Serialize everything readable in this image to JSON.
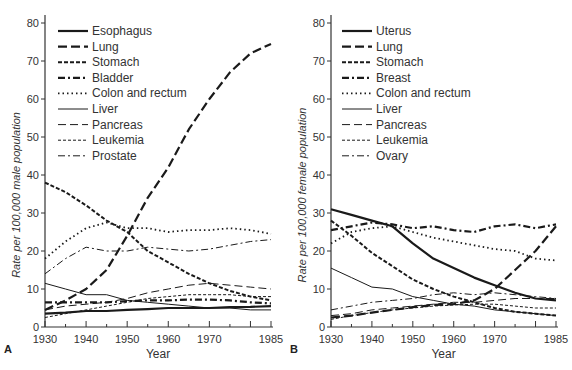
{
  "chart_data": [
    {
      "type": "line",
      "panel": "A",
      "title": "",
      "xlabel": "Year",
      "ylabel": "Rate per 100,000 male population",
      "xlim": [
        1930,
        1985
      ],
      "ylim": [
        0,
        80
      ],
      "xticks": [
        1930,
        1940,
        1950,
        1960,
        1970,
        1985
      ],
      "yticks": [
        0,
        10,
        20,
        30,
        40,
        50,
        60,
        70,
        80
      ],
      "grid": false,
      "legend_position": "upper left",
      "x": [
        1930,
        1935,
        1940,
        1945,
        1950,
        1955,
        1960,
        1965,
        1970,
        1975,
        1980,
        1985
      ],
      "series": [
        {
          "name": "Esophagus",
          "style": "solid-thick",
          "values": [
            3.5,
            3.8,
            4.2,
            4.2,
            4.5,
            4.7,
            5.0,
            5.0,
            5.0,
            5.2,
            5.3,
            5.5
          ]
        },
        {
          "name": "Lung",
          "style": "long-dash-thick",
          "values": [
            4.5,
            7.0,
            10.0,
            15.0,
            24.0,
            34.0,
            42.0,
            52.0,
            60.0,
            67.0,
            72.0,
            74.5
          ]
        },
        {
          "name": "Stomach",
          "style": "short-dash-thick",
          "values": [
            38.0,
            35.5,
            32.0,
            28.0,
            25.0,
            20.0,
            17.0,
            14.0,
            11.5,
            9.5,
            8.0,
            7.0
          ]
        },
        {
          "name": "Bladder",
          "style": "dash-dot-thick",
          "values": [
            6.5,
            6.5,
            6.5,
            6.5,
            6.8,
            7.0,
            7.0,
            7.2,
            7.2,
            7.0,
            6.5,
            6.2
          ]
        },
        {
          "name": "Colon and rectum",
          "style": "dotted",
          "values": [
            18.0,
            22.5,
            26.0,
            27.5,
            26.0,
            26.0,
            25.0,
            25.5,
            25.5,
            26.0,
            25.5,
            24.5
          ]
        },
        {
          "name": "Liver",
          "style": "solid-thin",
          "values": [
            11.5,
            10.0,
            8.5,
            8.5,
            7.0,
            6.5,
            6.0,
            5.5,
            5.0,
            5.0,
            4.5,
            4.5
          ]
        },
        {
          "name": "Pancreas",
          "style": "long-dash-thin",
          "values": [
            4.5,
            5.5,
            6.0,
            6.5,
            7.5,
            9.0,
            10.0,
            11.0,
            11.5,
            11.0,
            10.5,
            10.0
          ]
        },
        {
          "name": "Leukemia",
          "style": "short-dash-thin",
          "values": [
            2.5,
            3.5,
            4.5,
            5.5,
            6.5,
            7.5,
            8.0,
            8.5,
            8.5,
            8.5,
            8.0,
            8.0
          ]
        },
        {
          "name": "Prostate",
          "style": "dash-dot-thin",
          "values": [
            14.0,
            18.0,
            21.0,
            20.0,
            20.0,
            21.0,
            20.5,
            20.0,
            20.5,
            21.5,
            22.5,
            23.0
          ]
        }
      ]
    },
    {
      "type": "line",
      "panel": "B",
      "title": "",
      "xlabel": "Year",
      "ylabel": "Rate per 100,000 female population",
      "xlim": [
        1930,
        1985
      ],
      "ylim": [
        0,
        80
      ],
      "xticks": [
        1930,
        1940,
        1950,
        1960,
        1970,
        1985
      ],
      "yticks": [
        0,
        10,
        20,
        30,
        40,
        50,
        60,
        70,
        80
      ],
      "grid": false,
      "legend_position": "upper left",
      "x": [
        1930,
        1935,
        1940,
        1945,
        1950,
        1955,
        1960,
        1965,
        1970,
        1975,
        1980,
        1985
      ],
      "series": [
        {
          "name": "Uterus",
          "style": "solid-thick",
          "values": [
            31.0,
            29.5,
            28.0,
            26.5,
            22.0,
            18.0,
            15.5,
            13.0,
            11.0,
            9.0,
            7.5,
            7.0
          ]
        },
        {
          "name": "Lung",
          "style": "long-dash-thick",
          "values": [
            2.5,
            3.0,
            3.8,
            4.5,
            5.2,
            5.8,
            6.0,
            7.0,
            10.0,
            15.0,
            20.0,
            26.5
          ]
        },
        {
          "name": "Stomach",
          "style": "short-dash-thick",
          "values": [
            28.0,
            24.0,
            19.5,
            16.0,
            12.5,
            10.0,
            8.0,
            6.5,
            5.0,
            4.0,
            3.5,
            3.0
          ]
        },
        {
          "name": "Breast",
          "style": "dash-dot-thick",
          "values": [
            25.5,
            26.5,
            27.5,
            27.0,
            26.0,
            26.5,
            25.5,
            25.0,
            26.5,
            27.0,
            26.0,
            27.0
          ]
        },
        {
          "name": "Colon and rectum",
          "style": "dotted",
          "values": [
            22.0,
            25.0,
            26.0,
            26.5,
            25.0,
            23.5,
            22.5,
            21.5,
            20.5,
            20.0,
            18.0,
            17.5
          ]
        },
        {
          "name": "Liver",
          "style": "solid-thin",
          "values": [
            15.5,
            13.0,
            10.5,
            10.0,
            8.0,
            7.0,
            6.0,
            5.5,
            4.5,
            4.0,
            3.5,
            3.0
          ]
        },
        {
          "name": "Pancreas",
          "style": "long-dash-thin",
          "values": [
            3.0,
            3.5,
            4.5,
            5.0,
            5.5,
            6.0,
            6.5,
            6.5,
            7.0,
            7.5,
            7.5,
            7.5
          ]
        },
        {
          "name": "Leukemia",
          "style": "short-dash-thin",
          "values": [
            2.0,
            3.0,
            3.8,
            4.5,
            5.0,
            5.5,
            5.8,
            6.0,
            6.0,
            5.5,
            5.0,
            5.0
          ]
        },
        {
          "name": "Ovary",
          "style": "dash-dot-thin",
          "values": [
            4.5,
            5.5,
            6.5,
            7.0,
            7.5,
            8.5,
            9.0,
            8.5,
            9.0,
            8.5,
            8.0,
            7.5
          ]
        }
      ]
    }
  ]
}
